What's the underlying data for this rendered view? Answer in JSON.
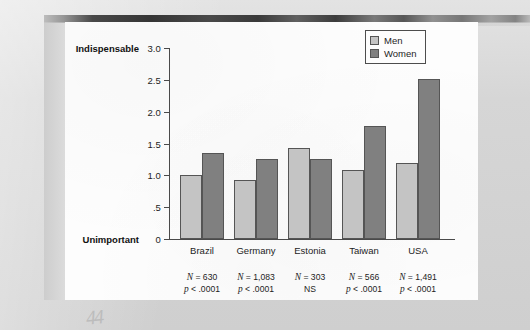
{
  "colors": {
    "men_fill": "#c4c4c4",
    "women_fill": "#808080",
    "bar_stroke": "#555555",
    "axis": "#4a4a4a",
    "card_bg": "#fdfdfd",
    "page_bg": "#d9d9d9"
  },
  "legend": {
    "position": "top-right",
    "entries": [
      {
        "label": "Men",
        "swatch": "men"
      },
      {
        "label": "Women",
        "swatch": "women"
      }
    ]
  },
  "axis": {
    "y_anchor_top": "Indispensable",
    "y_anchor_bottom": "Unimportant",
    "y_ticks": [
      "3.0",
      "2.5",
      "2.0",
      "1.5",
      "1.0",
      ".5",
      "0"
    ]
  },
  "notes": [
    {
      "n": "N = 630",
      "p": "p < .0001"
    },
    {
      "n": "N = 1,083",
      "p": "p < .0001"
    },
    {
      "n": "N = 303",
      "p": "NS"
    },
    {
      "n": "N = 566",
      "p": "p < .0001"
    },
    {
      "n": "N = 1,491",
      "p": "p < .0001"
    }
  ],
  "artifact": {
    "handwriting": "44"
  },
  "chart_data": {
    "type": "bar",
    "title": "",
    "xlabel": "",
    "ylabel": "",
    "ylim": [
      0,
      3.0
    ],
    "yticks": [
      0,
      0.5,
      1.0,
      1.5,
      2.0,
      2.5,
      3.0
    ],
    "ytick_labels": [
      "0",
      ".5",
      "1.0",
      "1.5",
      "2.0",
      "2.5",
      "3.0"
    ],
    "y_axis_anchors": {
      "low": "Unimportant",
      "high": "Indispensable"
    },
    "grid": false,
    "legend_position": "upper right",
    "categories": [
      "Brazil",
      "Germany",
      "Estonia",
      "Taiwan",
      "USA"
    ],
    "series": [
      {
        "name": "Men",
        "values": [
          1.0,
          0.93,
          1.43,
          1.09,
          1.2
        ]
      },
      {
        "name": "Women",
        "values": [
          1.35,
          1.25,
          1.26,
          1.77,
          2.51
        ]
      }
    ],
    "annotations": [
      {
        "category": "Brazil",
        "N": 630,
        "p": "p < .0001"
      },
      {
        "category": "Germany",
        "N": 1083,
        "p": "p < .0001"
      },
      {
        "category": "Estonia",
        "N": 303,
        "p": "NS"
      },
      {
        "category": "Taiwan",
        "N": 566,
        "p": "p < .0001"
      },
      {
        "category": "USA",
        "N": 1491,
        "p": "p < .0001"
      }
    ]
  }
}
